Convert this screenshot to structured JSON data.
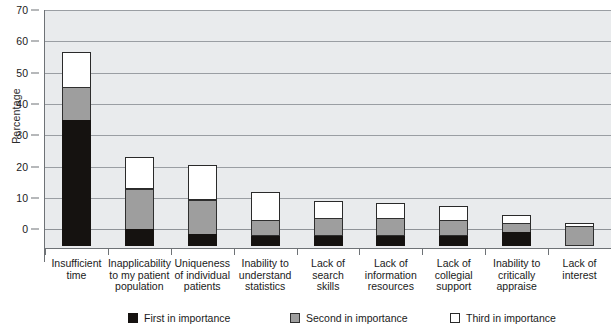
{
  "chart_data": {
    "type": "bar",
    "subtype": "stacked-vertical",
    "title": "",
    "xlabel": "",
    "ylabel": "Percentage",
    "ylim": [
      -6,
      70
    ],
    "yticks": [
      0,
      10,
      20,
      30,
      40,
      50,
      60,
      70
    ],
    "ytick_labels": [
      "0",
      "10",
      "20",
      "30",
      "40",
      "50",
      "60",
      "70"
    ],
    "grid": true,
    "grid_axis": "y",
    "legend_position": "bottom",
    "categories": [
      "Insufficient time",
      "Inapplicability to my patient population",
      "Uniqueness of individual patients",
      "Inability to understand statistics",
      "Lack of search skills",
      "Lack of information resources",
      "Lack of collegial support",
      "Inability to critically appraise",
      "Lack of interest"
    ],
    "category_lines": [
      [
        "Insufficient",
        "time"
      ],
      [
        "Inapplicability",
        "to my patient",
        "population"
      ],
      [
        "Uniqueness",
        "of individual",
        "patients"
      ],
      [
        "Inability to",
        "understand",
        "statistics"
      ],
      [
        "Lack of",
        "search",
        "skills"
      ],
      [
        "Lack of",
        "information",
        "resources"
      ],
      [
        "Lack of",
        "collegial",
        "support"
      ],
      [
        "Inability to",
        "critically",
        "appraise"
      ],
      [
        "Lack of",
        "interest"
      ]
    ],
    "series": [
      {
        "name": "First in importance",
        "color": "#151210",
        "values": [
          35,
          0,
          -1.5,
          -2,
          -2,
          -2,
          -2,
          -1,
          -5
        ]
      },
      {
        "name": "Second in importance",
        "color": "#9e9e9e",
        "values": [
          10.5,
          13,
          11,
          5,
          5.5,
          5.5,
          5,
          3,
          6
        ]
      },
      {
        "name": "Third in importance",
        "color": "#ffffff",
        "values": [
          11,
          10,
          11,
          9,
          5.5,
          5,
          4.5,
          2.5,
          1
        ]
      }
    ],
    "totals": [
      56.5,
      23,
      20.5,
      12,
      9,
      8.5,
      7.5,
      4.5,
      2
    ]
  },
  "legend": {
    "items": [
      {
        "label": "First in importance",
        "color": "#151210",
        "swatch": "first"
      },
      {
        "label": "Second in importance",
        "color": "#9e9e9e",
        "swatch": "second"
      },
      {
        "label": "Third in importance",
        "color": "#ffffff",
        "swatch": "third"
      }
    ]
  },
  "axis": {
    "y_title": "Percentage"
  },
  "colors": {
    "plot_background": "#e9ebed",
    "gridline": "#9a9ea3",
    "axis": "#6e7276",
    "text": "#1a1a1a"
  }
}
